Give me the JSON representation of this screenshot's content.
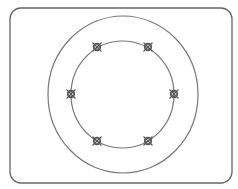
{
  "diagram": {
    "frame": {
      "x": 10,
      "y": 8,
      "width": 222,
      "height": 175,
      "radius": 11,
      "stroke": "#666666"
    },
    "outer_circle": {
      "cx": 123,
      "cy": 94.5,
      "rx": 75,
      "ry": 78.5,
      "stroke": "#777777"
    },
    "inner_circle": {
      "cx": 122.5,
      "cy": 94.5,
      "rx": 51.5,
      "ry": 53.5,
      "stroke": "#777777"
    },
    "markers": [
      {
        "x": 97,
        "y": 47,
        "symbol": "circle-x-icon"
      },
      {
        "x": 148,
        "y": 47,
        "symbol": "circle-x-icon"
      },
      {
        "x": 71,
        "y": 94,
        "symbol": "circle-x-icon"
      },
      {
        "x": 174,
        "y": 94,
        "symbol": "circle-x-icon"
      },
      {
        "x": 97,
        "y": 141,
        "symbol": "circle-x-icon"
      },
      {
        "x": 148,
        "y": 141,
        "symbol": "circle-x-icon"
      }
    ],
    "marker_color": "#555555"
  }
}
